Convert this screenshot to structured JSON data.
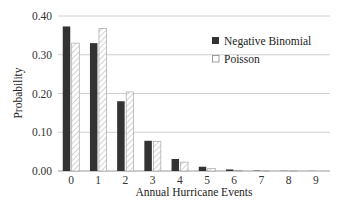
{
  "chart_data": {
    "type": "bar",
    "title": "",
    "xlabel": "Annual Hurricane Events",
    "ylabel": "Probability",
    "categories": [
      "0",
      "1",
      "2",
      "3",
      "4",
      "5",
      "6",
      "7",
      "8",
      "9"
    ],
    "series": [
      {
        "name": "Negative Binomial",
        "color": "#333333",
        "pattern": "solid",
        "values": [
          0.373,
          0.33,
          0.18,
          0.078,
          0.031,
          0.011,
          0.004,
          0.001,
          0.0005,
          0.0002
        ]
      },
      {
        "name": "Poisson",
        "color": "#ffffff",
        "pattern": "hatched",
        "values": [
          0.33,
          0.368,
          0.204,
          0.076,
          0.023,
          0.007,
          0.002,
          0.0004,
          0.0001,
          0.0
        ]
      }
    ],
    "ylim": [
      0,
      0.4
    ],
    "yticks": [
      "0.00",
      "0.10",
      "0.20",
      "0.30",
      "0.40"
    ],
    "grid": true,
    "legend_position": "upper right"
  },
  "axes": {
    "xlabel": "Annual Hurricane Events",
    "ylabel": "Probability"
  },
  "legend": {
    "items": [
      {
        "label": "Negative Binomial"
      },
      {
        "label": "Poisson"
      }
    ]
  }
}
